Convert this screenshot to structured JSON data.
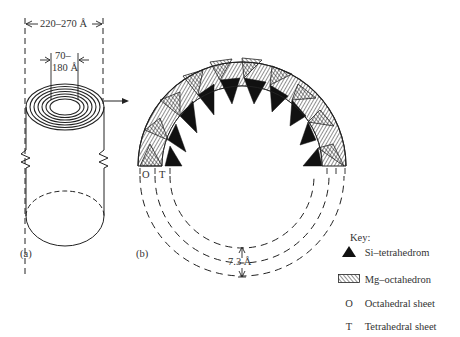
{
  "panel_a": {
    "label": "(a)",
    "outer_diameter": "220–270 Å",
    "inner_diameter_line1": "70–",
    "inner_diameter_line2": "180 Å"
  },
  "panel_b": {
    "label": "(b)",
    "octahedral_marker": "O",
    "tetrahedral_marker": "T",
    "layer_spacing": "7.3 Å"
  },
  "key": {
    "title": "Key:",
    "items": [
      {
        "symbol": "filled-triangle",
        "label": "Si–tetrahedrom"
      },
      {
        "symbol": "hatched-rectangle",
        "label": "Mg–octahedron"
      },
      {
        "symbol": "O",
        "label": "Octahedral sheet"
      },
      {
        "symbol": "T",
        "label": "Tetrahedral sheet"
      }
    ]
  },
  "colors": {
    "line": "#222222",
    "fill_dark": "#111111",
    "background": "#ffffff"
  }
}
